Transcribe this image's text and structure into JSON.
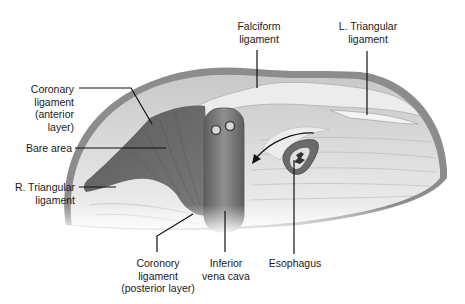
{
  "figure": {
    "colors": {
      "background": "#ffffff",
      "capsule_rim": "#8c8c8c",
      "liver_surface": "#d6d6d6",
      "bare_area": "#6e6e6e",
      "ivc": "#7d7d7d",
      "esophagus": "#6a6a6a",
      "leader_line": "#111111"
    }
  },
  "labels": {
    "falciform": "Falciform\nligament",
    "l_triangular": "L. Triangular\nligament",
    "coronary_anterior": "Coronary\nligament\n(anterior\nlayer)",
    "bare_area": "Bare area",
    "r_triangular": "R. Triangular\nligament",
    "coronary_posterior": "Coronory\nligament\n(posterior layer)",
    "ivc": "Inferior\nvena cava",
    "esophagus": "Esophagus"
  }
}
